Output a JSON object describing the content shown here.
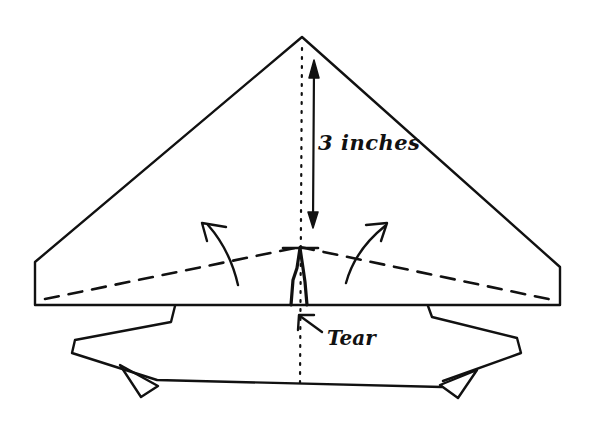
{
  "diagram": {
    "labels": {
      "dimension": "3 inches",
      "tear": "Tear"
    },
    "colors": {
      "ink": "#111111",
      "background": "#ffffff"
    },
    "parts": [
      "triangular-wing",
      "center-fold-line",
      "dashed-fold-lines",
      "fold-up-arrows",
      "dimension-arrow",
      "tear-slit",
      "lower-body-outline"
    ]
  }
}
